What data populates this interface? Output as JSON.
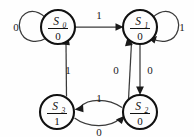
{
  "diagram": {
    "type": "state-transition-diagram",
    "title": "",
    "background_color": "#fefefe",
    "node_stroke_color": "#111111",
    "edge_stroke_color": "#3a3a3a",
    "label_color": "#1a1a1a",
    "states": [
      {
        "id": "S0",
        "name": "S",
        "subscript": "0",
        "output": "0",
        "cx": 58,
        "cy": 27,
        "r": 17
      },
      {
        "id": "S1",
        "name": "S",
        "subscript": "1",
        "output": "0",
        "cx": 140,
        "cy": 27,
        "r": 17
      },
      {
        "id": "S3",
        "name": "S",
        "subscript": "3",
        "output": "1",
        "cx": 57,
        "cy": 112,
        "r": 17
      },
      {
        "id": "S2",
        "name": "S",
        "subscript": "2",
        "output": "0",
        "cx": 140,
        "cy": 112,
        "r": 17
      }
    ],
    "transitions": [
      {
        "id": "t-s0-s0",
        "from": "S0",
        "to": "S0",
        "label": "0",
        "kind": "self-loop-left",
        "label_x": 16,
        "label_y": 31
      },
      {
        "id": "t-s0-s1",
        "from": "S0",
        "to": "S1",
        "label": "1",
        "kind": "straight-top",
        "label_x": 99,
        "label_y": 19
      },
      {
        "id": "t-s1-s1",
        "from": "S1",
        "to": "S1",
        "label": "1",
        "kind": "self-loop-right",
        "label_x": 182,
        "label_y": 31
      },
      {
        "id": "t-s1-s2",
        "from": "S1",
        "to": "S2",
        "label": "0",
        "kind": "straight-right",
        "label_x": 150,
        "label_y": 74
      },
      {
        "id": "t-s2-s1",
        "from": "S2",
        "to": "S1",
        "label": "0",
        "kind": "diagonal-up-left",
        "label_x": 116,
        "label_y": 74
      },
      {
        "id": "t-s3-s0",
        "from": "S3",
        "to": "S0",
        "label": "1",
        "kind": "diagonal-up-right",
        "label_x": 68,
        "label_y": 74
      },
      {
        "id": "t-s2-s3",
        "from": "S2",
        "to": "S3",
        "label": "1",
        "kind": "curve-top",
        "label_x": 99,
        "label_y": 102
      },
      {
        "id": "t-s3-s2",
        "from": "S3",
        "to": "S2",
        "label": "0",
        "kind": "curve-bottom",
        "label_x": 99,
        "label_y": 135
      }
    ]
  }
}
